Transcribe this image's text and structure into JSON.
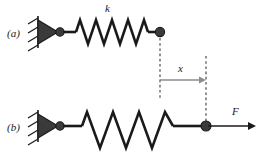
{
  "figure": {
    "background_color": "#ffffff",
    "ink_color": "#1a1a1a",
    "dimension_color": "#8c8c8c",
    "panels": [
      {
        "id": "a",
        "label": "(a)",
        "description": "relaxed spring attached to wall, free end at rest position",
        "spring_state": "relaxed",
        "spring_coils": 5
      },
      {
        "id": "b",
        "label": "(b)",
        "description": "stretched spring attached to wall, free end pulled right by force",
        "spring_state": "stretched",
        "spring_coils": 4
      }
    ],
    "annotations": {
      "spring_constant": "k",
      "displacement": "x",
      "force": "F"
    },
    "icons": {
      "wall_anchor": "hatched-wall-triangle-icon",
      "node": "mass-node-icon",
      "displacement_arrow": "right-arrow-icon",
      "force_arrow": "right-arrow-icon"
    }
  }
}
